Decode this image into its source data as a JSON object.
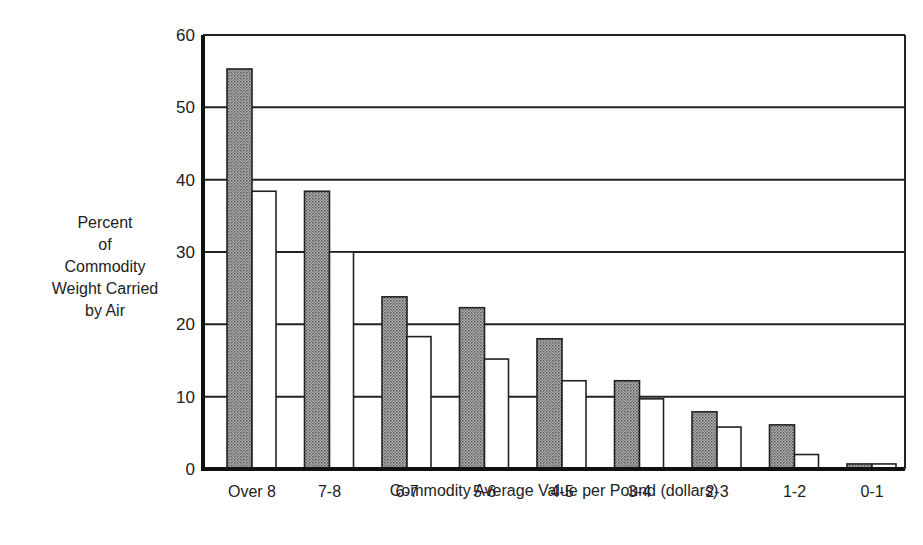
{
  "chart_data": {
    "type": "bar",
    "title": "",
    "xlabel": "Commodity Average Value per Pound (dollars)",
    "ylabel_lines": [
      "Percent",
      "of",
      "Commodity",
      "Weight Carried",
      "by Air"
    ],
    "ylabel": "Percent of Commodity Weight Carried by Air",
    "ylim": [
      0,
      60
    ],
    "yticks": [
      0,
      10,
      20,
      30,
      40,
      50,
      60
    ],
    "grid": true,
    "legend": "none",
    "categories": [
      "Over 8",
      "7-8",
      "6-7",
      "5-6",
      "4-5",
      "3-4",
      "2-3",
      "1-2",
      "0-1"
    ],
    "series": [
      {
        "name": "Series A (shaded)",
        "fill": "#9a9a9a",
        "pattern": "stipple",
        "values": [
          55.3,
          38.4,
          23.8,
          22.3,
          18.0,
          12.2,
          7.9,
          6.1,
          0.7
        ]
      },
      {
        "name": "Series B (white)",
        "fill": "#ffffff",
        "pattern": "none",
        "values": [
          38.4,
          30.0,
          18.3,
          15.2,
          12.2,
          9.7,
          5.8,
          2.0,
          0.7
        ]
      }
    ]
  }
}
